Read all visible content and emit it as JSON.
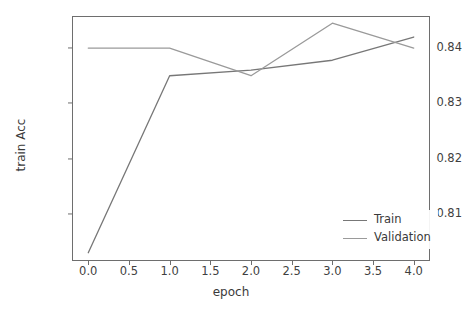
{
  "chart_data": {
    "type": "line",
    "title": "",
    "xlabel": "epoch",
    "ylabel": "train Acc",
    "x": [
      0.0,
      1.0,
      2.0,
      3.0,
      4.0
    ],
    "xlim": [
      -0.2,
      4.2
    ],
    "ylim": [
      0.8015,
      0.8458
    ],
    "xticks": [
      0.0,
      0.5,
      1.0,
      1.5,
      2.0,
      2.5,
      3.0,
      3.5,
      4.0
    ],
    "xtick_labels": [
      "0.0",
      "0.5",
      "1.0",
      "1.5",
      "2.0",
      "2.5",
      "3.0",
      "3.5",
      "4.0"
    ],
    "yticks": [
      0.81,
      0.82,
      0.83,
      0.84
    ],
    "ytick_labels": [
      "0.81",
      "0.82",
      "0.83",
      "0.84"
    ],
    "grid": false,
    "legend_position": "lower right",
    "series": [
      {
        "name": "Train",
        "color": "#777777",
        "values": [
          0.803,
          0.835,
          0.836,
          0.8378,
          0.842
        ]
      },
      {
        "name": "Validation",
        "color": "#9a9a9a",
        "values": [
          0.84,
          0.84,
          0.835,
          0.8445,
          0.84
        ]
      }
    ]
  },
  "legend": {
    "entries": [
      {
        "label": "Train"
      },
      {
        "label": "Validation"
      }
    ]
  },
  "axis_color": "#6e6e6e"
}
